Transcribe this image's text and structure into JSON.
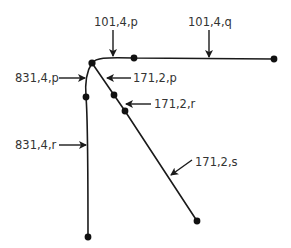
{
  "diagram": {
    "type": "tree",
    "colors": {
      "line": "#1a1a1a",
      "node": "#111111",
      "text": "#333333",
      "background": "#ffffff"
    },
    "nodes": [
      {
        "id": "junction",
        "x": 92,
        "y": 63
      },
      {
        "id": "top-mid",
        "x": 134,
        "y": 58
      },
      {
        "id": "top-end",
        "x": 274,
        "y": 59
      },
      {
        "id": "left-mid",
        "x": 86,
        "y": 97
      },
      {
        "id": "left-end",
        "x": 88,
        "y": 237
      },
      {
        "id": "diag-1",
        "x": 114,
        "y": 95
      },
      {
        "id": "diag-2",
        "x": 125,
        "y": 111
      },
      {
        "id": "diag-end",
        "x": 197,
        "y": 221
      }
    ],
    "labels": [
      {
        "id": "101-4-p",
        "text": "101,4,p"
      },
      {
        "id": "101-4-q",
        "text": "101,4,q"
      },
      {
        "id": "831-4-p",
        "text": "831,4,p"
      },
      {
        "id": "171-2-p",
        "text": "171,2,p"
      },
      {
        "id": "171-2-r",
        "text": "171,2,r"
      },
      {
        "id": "831-4-r",
        "text": "831,4,r"
      },
      {
        "id": "171-2-s",
        "text": "171,2,s"
      }
    ]
  }
}
